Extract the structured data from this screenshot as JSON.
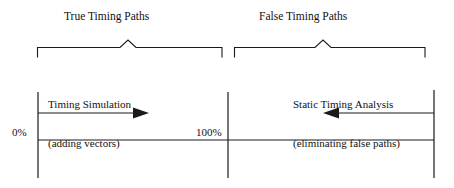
{
  "diagram": {
    "type": "timing-paths-coverage-diagram",
    "groups": [
      {
        "id": "true-timing-paths",
        "label": "True Timing Paths"
      },
      {
        "id": "false-timing-paths",
        "label": "False Timing Paths"
      }
    ],
    "annotations": [
      {
        "id": "timing-simulation",
        "line1": "Timing Simulation",
        "line2": "(adding vectors)",
        "arrow_direction": "right"
      },
      {
        "id": "static-timing-analysis",
        "line1": "Static Timing Analysis",
        "line2": "(eliminating false paths)",
        "arrow_direction": "left"
      }
    ],
    "axis": {
      "start_label": "0%",
      "mid_label": "100%"
    },
    "colors": {
      "stroke": "#1a1a1a",
      "text": "#111111",
      "background": "#ffffff"
    }
  }
}
